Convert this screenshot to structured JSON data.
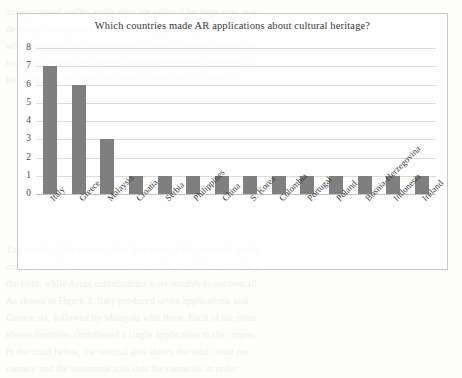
{
  "chart_data": {
    "type": "bar",
    "title": "Which countries made AR applications about cultural heritage?",
    "xlabel": "",
    "ylabel": "",
    "categories": [
      "Italy",
      "Greece",
      "Malaysia",
      "Croatia",
      "Serbia",
      "Philippines",
      "China",
      "S. Korea",
      "Colombia",
      "Portugal",
      "Poland",
      "Bosnia-Herzegovina",
      "Indonesia",
      "Ireland"
    ],
    "values": [
      7,
      6,
      3,
      1,
      1,
      1,
      1,
      1,
      1,
      1,
      1,
      1,
      1,
      1
    ],
    "ylim": [
      0,
      8
    ],
    "yticks": [
      "0",
      "1",
      "2",
      "3",
      "4",
      "5",
      "6",
      "7",
      "8"
    ],
    "grid": true,
    "legend": false,
    "bar_color": "#7f7f7f",
    "grid_color": "#dcdcd8",
    "border_color": "#c9c9c4"
  },
  "background_text": {
    "lines": [
      "an augmented reality application for cultural heritage sites was",
      "developed using marker based tracking techniques and tested",
      "with visitors at the museum over a period of several months to",
      "evaluate usability and overall visitor engagement outcomes in",
      "the field of digital heritage interpretation and presentation.",
      "",
      "",
      "",
      "",
      "",
      "",
      "",
      "",
      "",
      "The results of the survey show that most of the reviewed works",
      "originated in European countries with Italy and Greece leading",
      "the field, while Asian contributions were notably fewer overall.",
      "As shown in Figure 3, Italy produced seven applications and",
      "Greece six, followed by Malaysia with three. Each of the other",
      "eleven countries contributed a single application to the corpus.",
      "In the chart below, the vertical axis shows the total count per",
      "country and the horizontal axis lists the countries in order."
    ]
  }
}
